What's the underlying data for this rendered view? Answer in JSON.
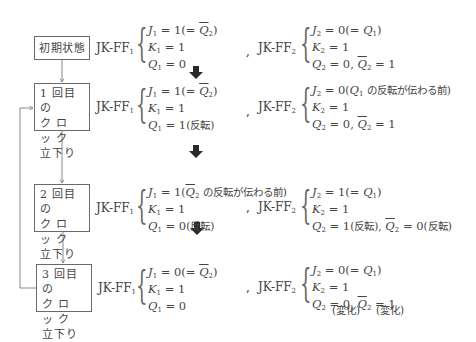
{
  "states": [
    {
      "label_lines": [
        "初期状態"
      ],
      "ff1": {
        "name": "JK-FF",
        "sub": "1",
        "eq": [
          {
            "var": "J",
            "sub": "1",
            "rhs": "= 1",
            "note_pre": "(= ",
            "note_var": "Q",
            "note_sub": "2",
            "note_overline": true,
            "note_post": ")"
          },
          {
            "var": "K",
            "sub": "1",
            "rhs": "= 1"
          },
          {
            "var": "Q",
            "sub": "1",
            "rhs": "= 0"
          }
        ]
      },
      "ff2": {
        "name": "JK-FF",
        "sub": "2",
        "eq": [
          {
            "var": "J",
            "sub": "2",
            "rhs": "= 0",
            "note_pre": "(= ",
            "note_var": "Q",
            "note_sub": "1",
            "note_overline": false,
            "note_post": ")"
          },
          {
            "var": "K",
            "sub": "2",
            "rhs": "= 1"
          },
          {
            "var": "Q",
            "sub": "2",
            "rhs": "= 0,",
            "extra_var": "Q",
            "extra_sub": "2",
            "extra_rhs": "= 1"
          }
        ]
      }
    },
    {
      "label_lines": [
        "1 回目の",
        "ク ロ ッ ク",
        "立下り"
      ],
      "ff1": {
        "name": "JK-FF",
        "sub": "1",
        "eq": [
          {
            "var": "J",
            "sub": "1",
            "rhs": "= 1",
            "note_pre": "(= ",
            "note_var": "Q",
            "note_sub": "2",
            "note_overline": true,
            "note_post": ")"
          },
          {
            "var": "K",
            "sub": "1",
            "rhs": "= 1"
          },
          {
            "var": "Q",
            "sub": "1",
            "rhs": "= 1",
            "jp_note": "(反転)"
          }
        ]
      },
      "ff2": {
        "name": "JK-FF",
        "sub": "2",
        "eq": [
          {
            "var": "J",
            "sub": "2",
            "rhs": "= 0",
            "note_pre": "(",
            "note_var": "Q",
            "note_sub": "1",
            "note_overline": false,
            "note_post": " の反転が伝わる前)"
          },
          {
            "var": "K",
            "sub": "2",
            "rhs": "= 1"
          },
          {
            "var": "Q",
            "sub": "2",
            "rhs": "= 0,",
            "extra_var": "Q",
            "extra_sub": "2",
            "extra_rhs": "= 1"
          }
        ]
      }
    },
    {
      "label_lines": [
        "2 回目の",
        "ク ロ ッ ク",
        "立下り"
      ],
      "ff1": {
        "name": "JK-FF",
        "sub": "1",
        "eq": [
          {
            "var": "J",
            "sub": "1",
            "rhs": "= 1",
            "note_pre": "(",
            "note_var": "Q",
            "note_sub": "2",
            "note_overline": true,
            "note_post": " の反転が伝わる前)"
          },
          {
            "var": "K",
            "sub": "1",
            "rhs": "= 1"
          },
          {
            "var": "Q",
            "sub": "1",
            "rhs": "= 0",
            "jp_note": "(反転)"
          }
        ]
      },
      "ff2": {
        "name": "JK-FF",
        "sub": "2",
        "eq": [
          {
            "var": "J",
            "sub": "2",
            "rhs": "= 1",
            "note_pre": "(= ",
            "note_var": "Q",
            "note_sub": "1",
            "note_overline": false,
            "note_post": ")"
          },
          {
            "var": "K",
            "sub": "2",
            "rhs": "= 1"
          },
          {
            "var": "Q",
            "sub": "2",
            "rhs": "= 1",
            "jp_note": "(反転),",
            "extra_var": "Q",
            "extra_sub": "2",
            "extra_rhs": "= 0",
            "extra_jp": "(反転)"
          }
        ]
      }
    },
    {
      "label_lines": [
        "3 回目の",
        "ク ロ ッ ク",
        "立下り"
      ],
      "ff1": {
        "name": "JK-FF",
        "sub": "1",
        "eq": [
          {
            "var": "J",
            "sub": "1",
            "rhs": "= 0",
            "note_pre": "(= ",
            "note_var": "Q",
            "note_sub": "2",
            "note_overline": true,
            "note_post": ")"
          },
          {
            "var": "K",
            "sub": "1",
            "rhs": "= 1"
          },
          {
            "var": "Q",
            "sub": "1",
            "rhs": "= 0"
          }
        ]
      },
      "ff2": {
        "name": "JK-FF",
        "sub": "2",
        "eq": [
          {
            "var": "J",
            "sub": "2",
            "rhs": "= 0",
            "note_pre": "(= ",
            "note_var": "Q",
            "note_sub": "1",
            "note_overline": false,
            "note_post": ")"
          },
          {
            "var": "K",
            "sub": "2",
            "rhs": "= 1"
          },
          {
            "var": "Q",
            "sub": "2",
            "rhs": "= 0,",
            "extra_var": "Q",
            "extra_sub": "2",
            "extra_rhs": "= 1"
          }
        ],
        "change_notes": [
          "(変化)",
          "(変化)"
        ]
      }
    }
  ],
  "separator": ",",
  "colors": {
    "line": "#6a6a6a",
    "text": "#444444",
    "thick_arrow": "#2a2a2a"
  }
}
